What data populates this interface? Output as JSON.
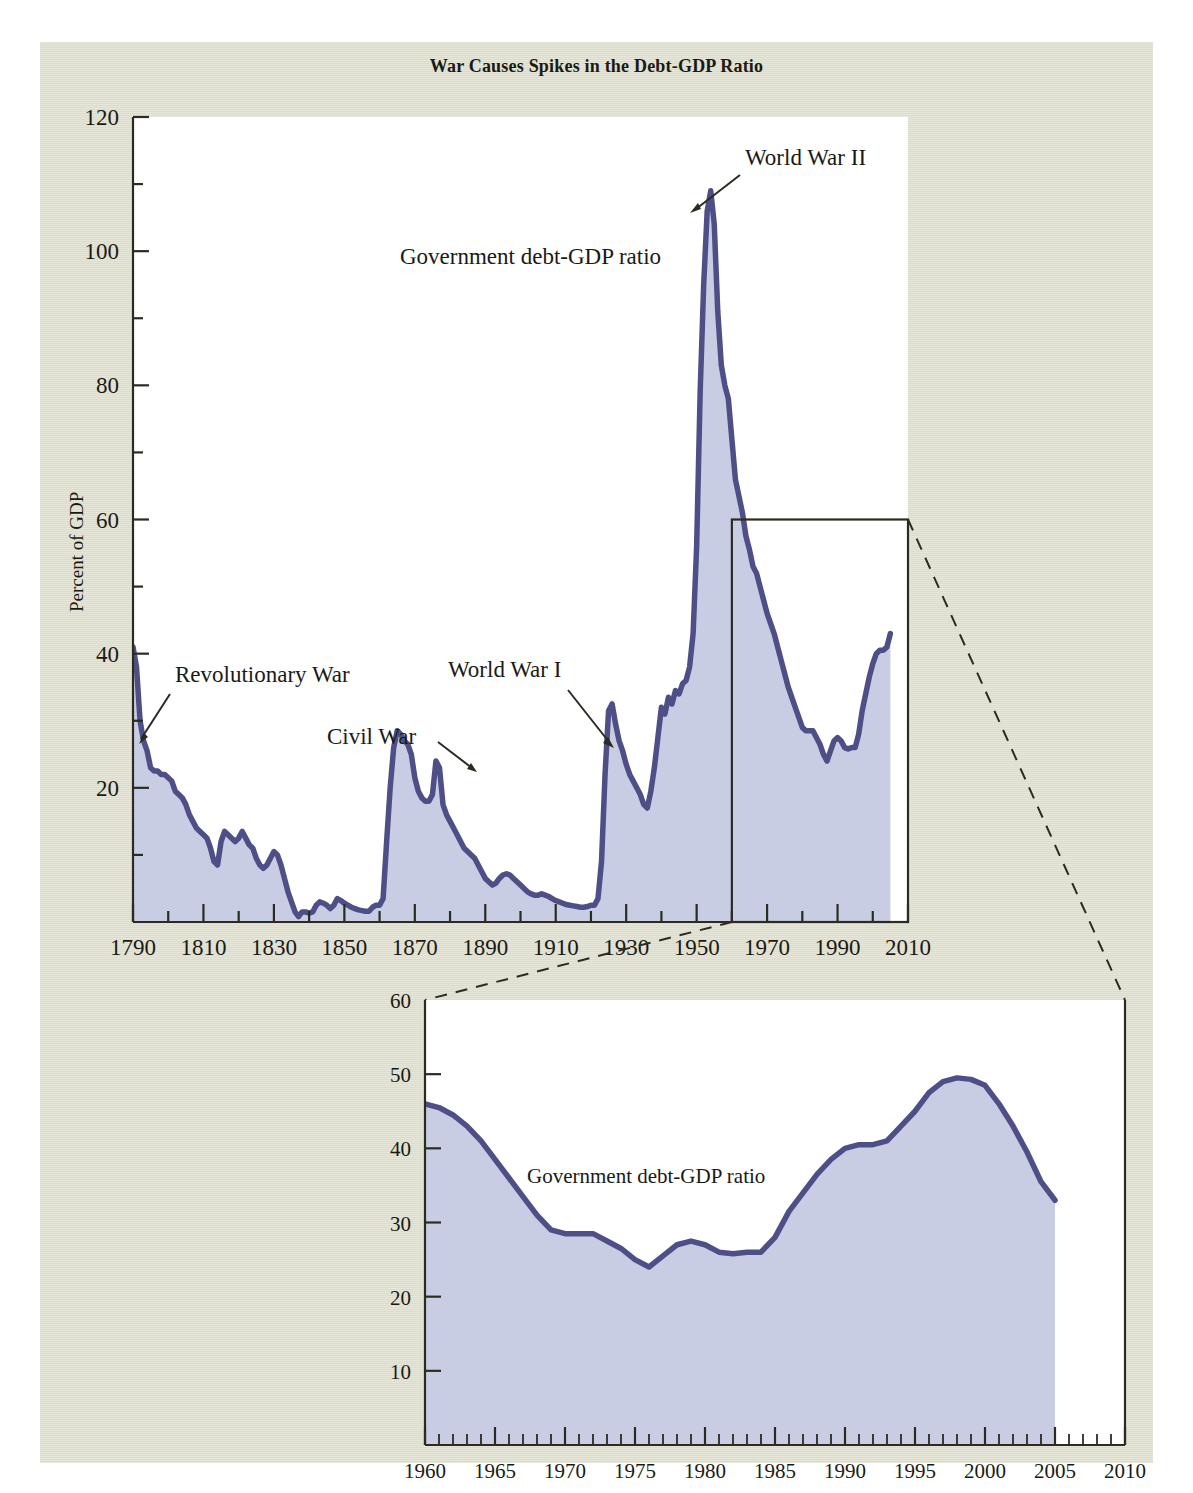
{
  "figure": {
    "title": "War Causes Spikes in the Debt-GDP Ratio",
    "background_color": "#dfe0cd",
    "plot_background_color": "#ffffff",
    "line_color": "#4e4f86",
    "fill_color": "#c8cde4"
  },
  "main_chart": {
    "ylabel": "Percent of GDP",
    "y_ticks": [
      "120",
      "100",
      "80",
      "60",
      "40",
      "20"
    ],
    "x_ticks": [
      "1790",
      "1810",
      "1830",
      "1850",
      "1870",
      "1890",
      "1910",
      "1930",
      "1950",
      "1970",
      "1990",
      "2010"
    ],
    "series_label": "Government debt-GDP ratio",
    "annotations": [
      {
        "name": "revolutionary-war",
        "text": "Revolutionary War"
      },
      {
        "name": "civil-war",
        "text": "Civil War"
      },
      {
        "name": "world-war-i",
        "text": "World  War I"
      },
      {
        "name": "world-war-ii",
        "text": "World War II"
      }
    ]
  },
  "inset_chart": {
    "y_ticks": [
      "60",
      "50",
      "40",
      "30",
      "20",
      "10"
    ],
    "x_ticks": [
      "1960",
      "1965",
      "1970",
      "1975",
      "1980",
      "1985",
      "1990",
      "1995",
      "2000",
      "2005",
      "2010"
    ],
    "series_label": "Government debt-GDP ratio"
  },
  "chart_data": [
    {
      "id": "main",
      "type": "area",
      "title": "War Causes Spikes in the Debt-GDP Ratio",
      "xlabel": "",
      "ylabel": "Percent of GDP",
      "xlim": [
        1790,
        2010
      ],
      "ylim": [
        0,
        120
      ],
      "y_major_ticks": [
        0,
        20,
        40,
        60,
        80,
        100,
        120
      ],
      "y_minor_ticks": [
        10,
        30,
        50,
        70,
        90,
        110
      ],
      "x_major_ticks": [
        1790,
        1810,
        1830,
        1850,
        1870,
        1890,
        1910,
        1930,
        1950,
        1970,
        1990,
        2010
      ],
      "x_minor_ticks": [
        1800,
        1820,
        1840,
        1860,
        1880,
        1900,
        1920,
        1940,
        1960,
        1980,
        2000
      ],
      "grid": false,
      "legend": "none",
      "series": [
        {
          "name": "Government debt-GDP ratio",
          "x": [
            1790,
            1791,
            1792,
            1793,
            1794,
            1795,
            1796,
            1797,
            1798,
            1799,
            1800,
            1801,
            1802,
            1803,
            1804,
            1805,
            1806,
            1807,
            1808,
            1809,
            1810,
            1811,
            1812,
            1813,
            1814,
            1815,
            1816,
            1817,
            1818,
            1819,
            1820,
            1821,
            1822,
            1823,
            1824,
            1825,
            1826,
            1827,
            1828,
            1829,
            1830,
            1831,
            1832,
            1833,
            1834,
            1835,
            1836,
            1837,
            1838,
            1839,
            1840,
            1841,
            1842,
            1843,
            1844,
            1845,
            1846,
            1847,
            1848,
            1849,
            1850,
            1851,
            1852,
            1853,
            1854,
            1855,
            1856,
            1857,
            1858,
            1859,
            1860,
            1861,
            1862,
            1863,
            1864,
            1865,
            1866,
            1867,
            1868,
            1869,
            1870,
            1871,
            1872,
            1873,
            1874,
            1875,
            1876,
            1877,
            1878,
            1879,
            1880,
            1881,
            1882,
            1883,
            1884,
            1885,
            1886,
            1887,
            1888,
            1889,
            1890,
            1891,
            1892,
            1893,
            1894,
            1895,
            1896,
            1897,
            1898,
            1899,
            1900,
            1901,
            1902,
            1903,
            1904,
            1905,
            1906,
            1907,
            1908,
            1909,
            1910,
            1911,
            1912,
            1913,
            1914,
            1915,
            1916,
            1917,
            1918,
            1919,
            1920,
            1921,
            1922,
            1923,
            1924,
            1925,
            1926,
            1927,
            1928,
            1929,
            1930,
            1931,
            1932,
            1933,
            1934,
            1935,
            1936,
            1937,
            1938,
            1939,
            1940,
            1941,
            1942,
            1943,
            1944,
            1945,
            1946,
            1947,
            1948,
            1949,
            1950,
            1951,
            1952,
            1953,
            1954,
            1955,
            1956,
            1957,
            1958,
            1959,
            1960,
            1961,
            1962,
            1963,
            1964,
            1965,
            1966,
            1967,
            1968,
            1969,
            1970,
            1971,
            1972,
            1973,
            1974,
            1975,
            1976,
            1977,
            1978,
            1979,
            1980,
            1981,
            1982,
            1983,
            1984,
            1985,
            1986,
            1987,
            1988,
            1989,
            1990,
            1991,
            1992,
            1993,
            1994,
            1995,
            1996,
            1997,
            1998,
            1999,
            2000,
            2001,
            2002,
            2003,
            2004,
            2005
          ],
          "y": [
            41.0,
            38.0,
            30.0,
            27.0,
            25.5,
            23.0,
            22.5,
            22.5,
            22.0,
            22.0,
            21.5,
            21.0,
            19.5,
            19.0,
            18.5,
            17.5,
            16.0,
            15.0,
            14.0,
            13.5,
            13.0,
            12.5,
            11.0,
            9.0,
            8.5,
            12.0,
            13.5,
            13.0,
            12.5,
            12.0,
            12.5,
            13.5,
            12.5,
            11.5,
            11.0,
            9.5,
            8.5,
            8.0,
            8.5,
            9.5,
            10.5,
            10.0,
            8.5,
            6.5,
            4.5,
            3.0,
            1.5,
            0.8,
            1.5,
            1.5,
            1.3,
            1.5,
            2.5,
            3.0,
            2.8,
            2.5,
            2.0,
            2.5,
            3.5,
            3.2,
            2.8,
            2.5,
            2.2,
            2.0,
            1.8,
            1.7,
            1.6,
            1.6,
            2.2,
            2.5,
            2.5,
            3.5,
            12.0,
            20.0,
            26.0,
            28.5,
            28.0,
            27.0,
            26.5,
            25.0,
            21.5,
            19.5,
            18.5,
            18.0,
            18.0,
            19.0,
            24.0,
            23.0,
            17.5,
            16.0,
            15.0,
            14.0,
            13.0,
            12.0,
            11.0,
            10.5,
            10.0,
            9.5,
            8.5,
            7.5,
            6.5,
            6.0,
            5.5,
            5.8,
            6.5,
            7.0,
            7.2,
            7.0,
            6.5,
            6.0,
            5.5,
            5.0,
            4.5,
            4.2,
            4.0,
            4.0,
            4.2,
            4.0,
            3.8,
            3.5,
            3.2,
            3.0,
            2.8,
            2.6,
            2.5,
            2.4,
            2.3,
            2.2,
            2.2,
            2.3,
            2.5,
            2.5,
            3.5,
            9.0,
            22.0,
            31.5,
            32.5,
            29.5,
            27.0,
            25.5,
            23.5,
            22.0,
            21.0,
            20.0,
            19.0,
            17.5,
            17.0,
            19.5,
            23.0,
            27.5,
            32.0,
            31.0,
            33.5,
            32.5,
            34.5,
            34.0,
            35.5,
            36.0,
            38.0,
            43.0,
            56.0,
            79.0,
            95.0,
            106.0,
            109.0,
            104.0,
            91.0,
            83.0,
            80.0,
            78.0,
            72.0,
            66.0,
            63.5,
            61.0,
            57.5,
            55.5,
            53.0,
            52.0,
            50.0,
            48.0,
            46.0,
            44.5,
            43.0,
            41.0,
            39.0,
            37.0,
            35.0,
            33.5,
            32.0,
            30.5,
            29.0,
            28.5,
            28.5,
            28.5,
            27.5,
            26.5,
            25.0,
            24.0,
            25.5,
            27.0,
            27.5,
            27.0,
            26.0,
            25.8,
            26.0,
            26.0,
            28.0,
            31.5,
            34.0,
            36.5,
            38.5,
            40.0,
            40.5,
            40.5,
            41.0,
            43.0,
            45.0,
            47.5,
            49.0,
            49.5,
            49.3,
            48.5,
            46.0,
            43.0,
            39.5,
            35.5,
            33.0,
            34.0,
            36.0,
            37.5,
            39.5
          ]
        }
      ],
      "annotations": [
        {
          "text": "Revolutionary War",
          "points_to_x": 1793,
          "points_to_y": 30
        },
        {
          "text": "Civil War",
          "points_to_x": 1864,
          "points_to_y": 26
        },
        {
          "text": "World  War I",
          "points_to_x": 1919,
          "points_to_y": 32
        },
        {
          "text": "World War II",
          "points_to_x": 1946,
          "points_to_y": 108
        },
        {
          "text": "Government debt-GDP ratio",
          "points_to_x": null,
          "points_to_y": null
        }
      ],
      "inset_highlight_box": {
        "x0": 1960,
        "x1": 2010,
        "y0": 0,
        "y1": 60
      }
    },
    {
      "id": "inset",
      "type": "area",
      "title": "",
      "xlabel": "",
      "ylabel": "",
      "xlim": [
        1960,
        2010
      ],
      "ylim": [
        0,
        60
      ],
      "y_major_ticks": [
        10,
        20,
        30,
        40,
        50,
        60
      ],
      "x_major_ticks": [
        1960,
        1965,
        1970,
        1975,
        1980,
        1985,
        1990,
        1995,
        2000,
        2005,
        2010
      ],
      "x_minor_tick_step": 1,
      "grid": false,
      "legend": "none",
      "series": [
        {
          "name": "Government debt-GDP ratio",
          "x": [
            1960,
            1961,
            1962,
            1963,
            1964,
            1965,
            1966,
            1967,
            1968,
            1969,
            1970,
            1971,
            1972,
            1973,
            1974,
            1975,
            1976,
            1977,
            1978,
            1979,
            1980,
            1981,
            1982,
            1983,
            1984,
            1985,
            1986,
            1987,
            1988,
            1989,
            1990,
            1991,
            1992,
            1993,
            1994,
            1995,
            1996,
            1997,
            1998,
            1999,
            2000,
            2001,
            2002,
            2003,
            2004,
            2005
          ],
          "y": [
            46.0,
            45.5,
            44.5,
            43.0,
            41.0,
            38.5,
            36.0,
            33.5,
            31.0,
            29.0,
            28.5,
            28.5,
            28.5,
            27.5,
            26.5,
            25.0,
            24.0,
            25.5,
            27.0,
            27.5,
            27.0,
            26.0,
            25.8,
            26.0,
            26.0,
            28.0,
            31.5,
            34.0,
            36.5,
            38.5,
            40.0,
            40.5,
            40.5,
            41.0,
            43.0,
            45.0,
            47.5,
            49.0,
            49.5,
            49.3,
            48.5,
            46.0,
            43.0,
            39.5,
            35.5,
            33.0
          ]
        }
      ],
      "annotations": [
        {
          "text": "Government debt-GDP ratio",
          "points_to_x": null,
          "points_to_y": null
        }
      ]
    }
  ]
}
